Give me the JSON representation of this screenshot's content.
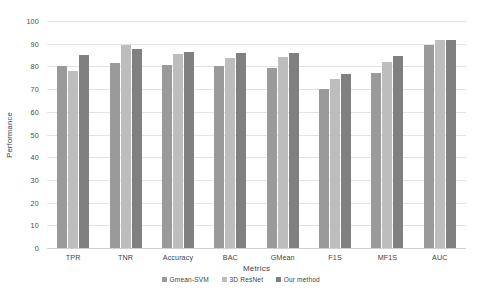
{
  "chart_data": {
    "type": "bar",
    "title": "",
    "xlabel": "Metrics",
    "ylabel": "Performance",
    "ylim": [
      0,
      100
    ],
    "yticks": [
      100,
      90,
      80,
      70,
      60,
      50,
      40,
      30,
      20,
      10,
      0
    ],
    "grid": true,
    "legend_position": "bottom",
    "categories": [
      "TPR",
      "TNR",
      "Accuracy",
      "BAC",
      "GMean",
      "F1S",
      "MF1S",
      "AUC"
    ],
    "series": [
      {
        "name": "Gmean-SVM",
        "color": "#9a9a9a",
        "values": [
          80,
          81.5,
          80.5,
          80,
          79.5,
          70,
          77,
          89.5
        ]
      },
      {
        "name": "3D ResNet",
        "color": "#bdbdbd",
        "values": [
          78,
          89.5,
          85.5,
          83.5,
          84,
          74.5,
          82,
          91.5
        ]
      },
      {
        "name": "Our method",
        "color": "#808080",
        "values": [
          85,
          87.5,
          86.5,
          86,
          86,
          76.5,
          84.5,
          91.5
        ]
      }
    ]
  }
}
